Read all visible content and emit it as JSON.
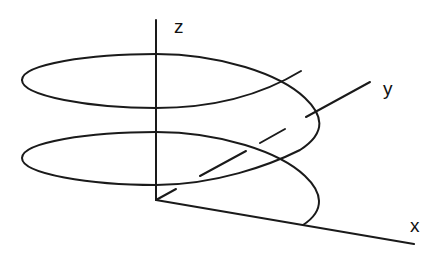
{
  "diagram": {
    "type": "3d-helix-coordinate-system",
    "stroke_color": "#1a1a1a",
    "background": "#ffffff",
    "axes": {
      "x": {
        "label": "x"
      },
      "y": {
        "label": "y",
        "style": "dashed"
      },
      "z": {
        "label": "z"
      }
    },
    "curve": {
      "name": "helix",
      "turns_visible": 2
    }
  }
}
